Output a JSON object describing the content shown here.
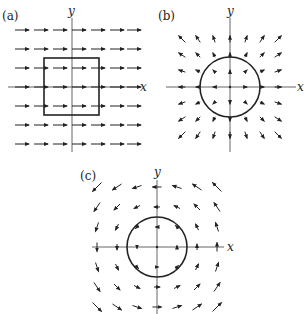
{
  "panels": [
    {
      "id": "a",
      "label": "(a)",
      "label_pos": [
        2,
        20
      ],
      "origin": [
        72,
        87
      ],
      "x_axis": {
        "label": "x",
        "from": 8,
        "to": 138,
        "label_pos": [
          140,
          91
        ]
      },
      "y_axis": {
        "label": "y",
        "from": 18,
        "to": 152,
        "label_pos": [
          68,
          15
        ]
      },
      "shape": {
        "type": "square",
        "x": 44,
        "y": 58,
        "w": 55,
        "h": 57
      },
      "field": "uniform",
      "grid": {
        "cols": [
          22,
          41,
          60,
          79,
          98,
          117,
          134
        ],
        "rows": [
          30,
          49,
          68,
          87,
          106,
          125,
          144
        ]
      },
      "arrow_len": 14
    },
    {
      "id": "b",
      "label": "(b)",
      "label_pos": [
        158,
        20
      ],
      "origin": [
        230,
        87
      ],
      "x_axis": {
        "label": "x",
        "from": 166,
        "to": 296,
        "label_pos": [
          297,
          91
        ]
      },
      "y_axis": {
        "label": "y",
        "from": 18,
        "to": 152,
        "label_pos": [
          227,
          15
        ]
      },
      "shape": {
        "type": "circle",
        "cx": 230,
        "cy": 87,
        "r": 30
      },
      "field": "radial",
      "grid": {
        "cols": [
          182,
          198,
          214,
          230,
          246,
          262,
          278
        ],
        "rows": [
          39,
          55,
          71,
          87,
          103,
          119,
          135
        ]
      },
      "arrow_scale": 0.14
    },
    {
      "id": "c",
      "label": "(c)",
      "label_pos": [
        80,
        180
      ],
      "origin": [
        157,
        247
      ],
      "x_axis": {
        "label": "x",
        "from": 92,
        "to": 224,
        "label_pos": [
          227,
          251
        ]
      },
      "y_axis": {
        "label": "y",
        "from": 180,
        "to": 314,
        "label_pos": [
          154,
          176
        ]
      },
      "shape": {
        "type": "circle",
        "cx": 157,
        "cy": 247,
        "r": 30
      },
      "field": "rotation",
      "grid": {
        "cols": [
          97,
          117,
          137,
          157,
          177,
          197,
          217
        ],
        "rows": [
          187,
          207,
          227,
          247,
          267,
          287,
          307
        ]
      },
      "arrow_scale": 0.15
    }
  ]
}
